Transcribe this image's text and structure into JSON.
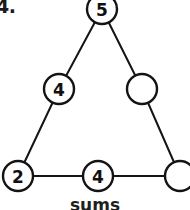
{
  "problem": {
    "number_label": "4.",
    "caption": "sums"
  },
  "figure": {
    "type": "triangle-number-puzzle",
    "stroke_color": "#141414",
    "fill_color": "#ffffff",
    "background_color": "#ffffff",
    "nodes": [
      {
        "id": "top",
        "name": "circle-top",
        "value": "5",
        "cx": 102,
        "cy": 9,
        "r": 15,
        "filled": false
      },
      {
        "id": "left-mid",
        "name": "circle-left-middle",
        "value": "4",
        "cx": 59,
        "cy": 89,
        "r": 15,
        "filled": false
      },
      {
        "id": "right-mid",
        "name": "circle-right-middle",
        "value": "",
        "cx": 142,
        "cy": 89,
        "r": 15,
        "filled": false
      },
      {
        "id": "bottom-left",
        "name": "circle-bottom-left",
        "value": "2",
        "cx": 18,
        "cy": 176,
        "r": 15,
        "filled": false
      },
      {
        "id": "bottom-mid",
        "name": "circle-bottom-middle",
        "value": "4",
        "cx": 98,
        "cy": 176,
        "r": 15,
        "filled": false
      },
      {
        "id": "bottom-right",
        "name": "circle-bottom-right",
        "value": "",
        "cx": 180,
        "cy": 176,
        "r": 15,
        "filled": false
      }
    ],
    "edges": [
      {
        "name": "edge-top-to-left-middle",
        "x1": 102,
        "y1": 9,
        "x2": 59,
        "y2": 89
      },
      {
        "name": "edge-left-middle-to-bottom-left",
        "x1": 59,
        "y1": 89,
        "x2": 18,
        "y2": 176
      },
      {
        "name": "edge-top-to-right-middle",
        "x1": 102,
        "y1": 9,
        "x2": 142,
        "y2": 89
      },
      {
        "name": "edge-right-middle-to-bottom-right",
        "x1": 142,
        "y1": 89,
        "x2": 180,
        "y2": 176
      },
      {
        "name": "edge-bottom-left-to-bottom-middle",
        "x1": 18,
        "y1": 176,
        "x2": 98,
        "y2": 176
      },
      {
        "name": "edge-bottom-middle-to-bottom-right",
        "x1": 98,
        "y1": 176,
        "x2": 180,
        "y2": 176
      }
    ]
  }
}
